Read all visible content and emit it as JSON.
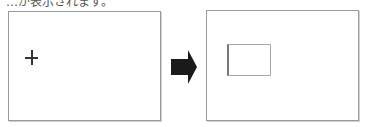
{
  "caption": "…が表示されます。",
  "panels": {
    "before": {
      "label": "before-state",
      "cursor": "crosshair"
    },
    "after": {
      "label": "after-state",
      "shape": "rectangle"
    }
  },
  "arrow": {
    "icon": "right-arrow-icon",
    "color": "#1a1a1a"
  },
  "colors": {
    "panel_border": "#9a9a9a",
    "cursor": "#333333",
    "arrow": "#1a1a1a"
  }
}
